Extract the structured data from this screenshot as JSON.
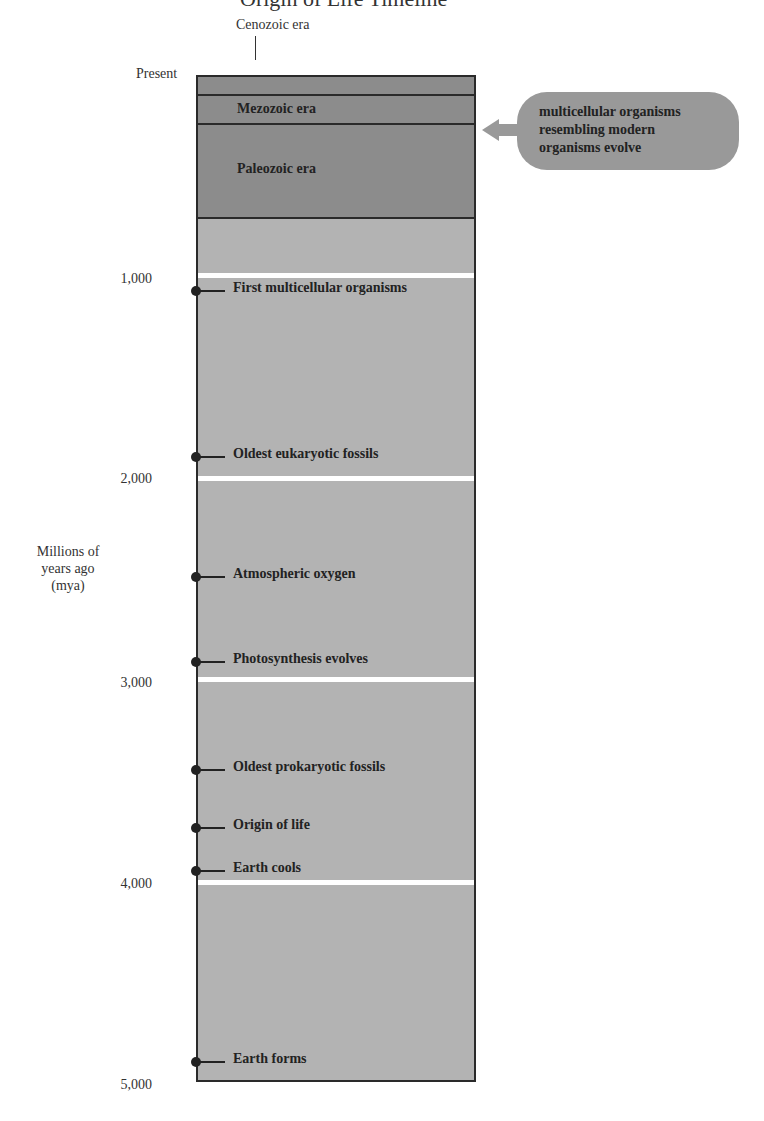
{
  "title": "Origin of Life Timeline",
  "axis": {
    "title": [
      "Millions of",
      "years ago",
      "(mya)"
    ],
    "ticks": [
      {
        "label": "Present",
        "value": 0
      },
      {
        "label": "1,000",
        "value": 1000
      },
      {
        "label": "2,000",
        "value": 2000
      },
      {
        "label": "3,000",
        "value": 3000
      },
      {
        "label": "4,000",
        "value": 4000
      },
      {
        "label": "5,000",
        "value": 5000
      }
    ]
  },
  "eras": [
    {
      "label": "Cenozoic era"
    },
    {
      "label": "Mezozoic era"
    },
    {
      "label": "Paleozoic era"
    }
  ],
  "callout": {
    "lines": [
      "multicellular organisms",
      "resembling modern",
      "organisms evolve"
    ]
  },
  "events": [
    {
      "label": "First multicellular organisms",
      "mya": 1100
    },
    {
      "label": "Oldest eukaryotic fossils",
      "mya": 1900
    },
    {
      "label": "Atmospheric oxygen",
      "mya": 2500
    },
    {
      "label": "Photosynthesis evolves",
      "mya": 2900
    },
    {
      "label": "Oldest prokaryotic fossils",
      "mya": 3450
    },
    {
      "label": "Origin of life",
      "mya": 3750
    },
    {
      "label": "Earth cools",
      "mya": 3950
    },
    {
      "label": "Earth forms",
      "mya": 4950
    }
  ]
}
